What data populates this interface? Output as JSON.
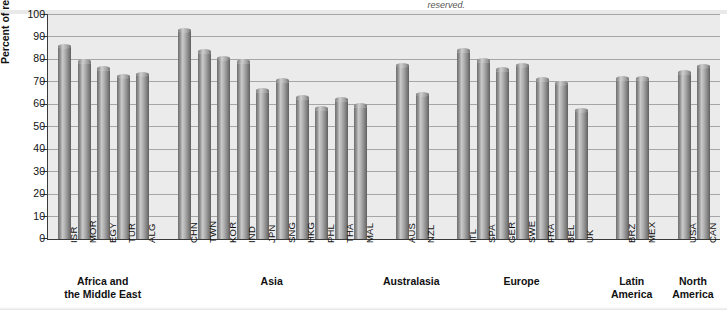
{
  "figure": {
    "top_note": "reserved.",
    "ylabel": "Percent of respondents"
  },
  "chart_data": {
    "type": "bar",
    "title": "",
    "xlabel": "",
    "ylabel": "Percent of respondents",
    "ylim": [
      0,
      100
    ],
    "ytick_step": 10,
    "grid": true,
    "legend": "none",
    "yticks": [
      "100",
      "90",
      "80",
      "70",
      "60",
      "50",
      "40",
      "30",
      "20",
      "10",
      "0"
    ],
    "categories": [
      "ISR",
      "MOR",
      "EGY",
      "TUR",
      "ALG",
      "CHN",
      "TWN",
      "KOR",
      "IND",
      "JPN",
      "SNG",
      "HKG",
      "PHL",
      "THA",
      "MAL",
      "AUS",
      "NZL",
      "ITL",
      "SPA",
      "GER",
      "SWE",
      "FRA",
      "BEL",
      "UK",
      "BRZ",
      "MEX",
      "USA",
      "CAN"
    ],
    "values": [
      86,
      79,
      76,
      72.5,
      73.5,
      93,
      83.5,
      80.5,
      79,
      66,
      70.5,
      63,
      58,
      62,
      59.5,
      77.5,
      64.5,
      84,
      79.5,
      75.5,
      77.5,
      71,
      69.5,
      57.5,
      71.5,
      71.5,
      74,
      77
    ],
    "groups": [
      {
        "label": "Africa and\nthe Middle East",
        "label_lines": [
          "Africa and",
          "the Middle East"
        ],
        "categories": [
          "ISR",
          "MOR",
          "EGY",
          "TUR",
          "ALG"
        ]
      },
      {
        "label": "Asia",
        "label_lines": [
          "Asia"
        ],
        "categories": [
          "CHN",
          "TWN",
          "KOR",
          "IND",
          "JPN",
          "SNG",
          "HKG",
          "PHL",
          "THA",
          "MAL"
        ]
      },
      {
        "label": "Australasia",
        "label_lines": [
          "Australasia"
        ],
        "categories": [
          "AUS",
          "NZL"
        ]
      },
      {
        "label": "Europe",
        "label_lines": [
          "Europe"
        ],
        "categories": [
          "ITL",
          "SPA",
          "GER",
          "SWE",
          "FRA",
          "BEL",
          "UK"
        ]
      },
      {
        "label": "Latin\nAmerica",
        "label_lines": [
          "Latin",
          "America"
        ],
        "categories": [
          "BRZ",
          "MEX"
        ]
      },
      {
        "label": "North\nAmerica",
        "label_lines": [
          "North",
          "America"
        ],
        "categories": [
          "USA",
          "CAN"
        ]
      }
    ],
    "colors": {
      "bar_light": "#c9c9c9",
      "bar_dark": "#5e5e5e",
      "plot_background": "#ebebeb",
      "gridline": "#9a9a9a",
      "axis": "#3a3a3a",
      "text": "#111111"
    }
  }
}
